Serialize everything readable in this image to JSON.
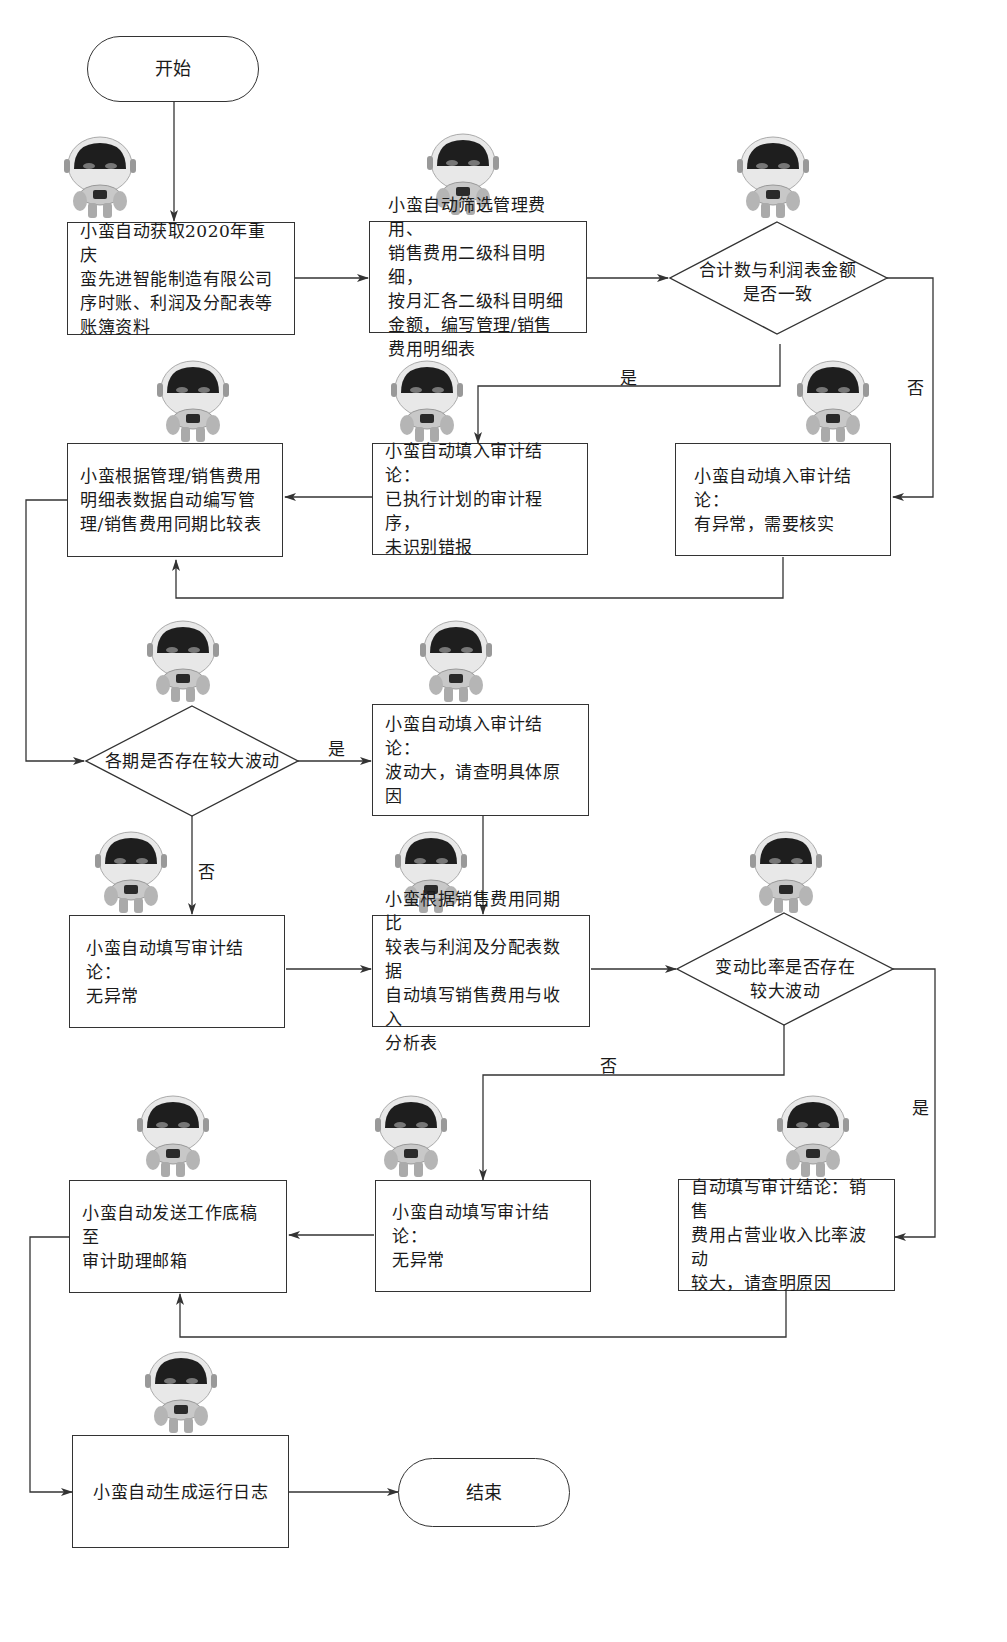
{
  "diagram": {
    "type": "flowchart",
    "terminals": {
      "start": "开始",
      "end": "结束"
    },
    "process_nodes": {
      "fetch_books": "小蛮自动获取2020年重庆\n蛮先进智能制造有限公司\n序时账、利润及分配表等\n账簿资料",
      "filter_expenses": "小蛮自动筛选管理费用、\n销售费用二级科目明细，\n按月汇各二级科目明细\n金额，编写管理/销售\n费用明细表",
      "compile_comparison": "小蛮根据管理/销售费用\n明细表数据自动编写管\n理/销售费用同期比较表",
      "conclusion_no_misstatement": "小蛮自动填入审计结论：\n已执行计划的审计程序，\n未识别错报",
      "conclusion_abnormal": "小蛮自动填入审计结论：\n有异常，需要核实",
      "conclusion_large_fluctuation": "小蛮自动填入审计结论：\n波动大，请查明具体原因",
      "conclusion_normal_1": "小蛮自动填写审计结论：\n无异常",
      "sales_income_analysis": "小蛮根据销售费用同期比\n较表与利润及分配表数据\n自动填写销售费用与收入\n分析表",
      "send_workpaper": "小蛮自动发送工作底稿至\n审计助理邮箱",
      "conclusion_normal_2": "小蛮自动填写审计结论：\n无异常",
      "conclusion_ratio_fluctuation": "自动填写审计结论：销售\n费用占营业收入比率波动\n较大，请查明原因",
      "generate_log": "小蛮自动生成运行日志"
    },
    "decision_nodes": {
      "totals_match": "合计数与利润表金额\n是否一致",
      "period_fluctuation": "各期是否存在较大波动",
      "ratio_fluctuation": "变动比率是否存在\n较大波动"
    },
    "edge_labels": {
      "yes": "是",
      "no": "否"
    },
    "icons": {
      "robot": "robot-icon"
    },
    "colors": {
      "stroke": "#333333",
      "background": "#ffffff",
      "robot_face": "#1e1e1e",
      "robot_body": "#bdbdbd"
    }
  }
}
